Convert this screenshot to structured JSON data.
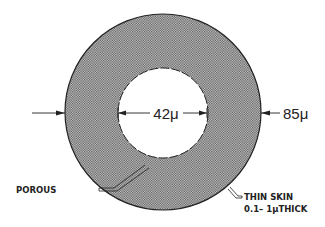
{
  "diagram": {
    "type": "cross-section",
    "inner_diameter_label": "42μ",
    "outer_diameter_label": "85μ",
    "callouts": {
      "porous": "POROUS",
      "skin_line1": "THIN  SKIN",
      "skin_line2": "0.1– 1μTHICK"
    },
    "colors": {
      "fill_dots": "#555555",
      "stroke": "#222222",
      "background": "#ffffff"
    }
  }
}
